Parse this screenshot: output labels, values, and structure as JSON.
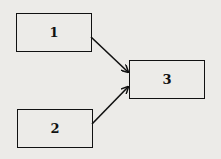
{
  "diagram": {
    "nodes": [
      {
        "id": "1",
        "label": "1"
      },
      {
        "id": "2",
        "label": "2"
      },
      {
        "id": "3",
        "label": "3"
      }
    ],
    "edges": [
      {
        "from": "1",
        "to": "3"
      },
      {
        "from": "2",
        "to": "3"
      }
    ],
    "colors": {
      "background": "#ecebe8",
      "stroke": "#111111"
    }
  }
}
